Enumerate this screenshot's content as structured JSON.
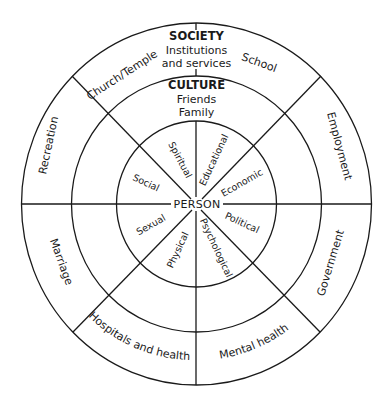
{
  "diagram": {
    "type": "concentric-wheel",
    "rings": [
      "PERSON",
      "CULTURE",
      "SOCIETY"
    ],
    "center": {
      "label": "PERSON"
    },
    "inner_ring": {
      "segments": [
        {
          "label": "Spiritual"
        },
        {
          "label": "Educational"
        },
        {
          "label": "Social"
        },
        {
          "label": "Economic"
        },
        {
          "label": "Sexual"
        },
        {
          "label": "Political"
        },
        {
          "label": "Physical"
        },
        {
          "label": "Psychological"
        }
      ]
    },
    "middle_ring": {
      "heading": "CULTURE",
      "lines": [
        "Friends",
        "Family"
      ]
    },
    "outer_ring": {
      "heading": "SOCIETY",
      "subheading_lines": [
        "Institutions",
        "and services"
      ],
      "segments": [
        {
          "label": "Church/Temple"
        },
        {
          "label": "School"
        },
        {
          "label": "Recreation"
        },
        {
          "label": "Employment"
        },
        {
          "label": "Marriage"
        },
        {
          "label": "Government"
        },
        {
          "label": "Hospitals and health"
        },
        {
          "label": "Mental health"
        }
      ]
    },
    "colors": {
      "line": "#1a1a1a",
      "text": "#1a1a1a",
      "background": "#ffffff"
    }
  }
}
